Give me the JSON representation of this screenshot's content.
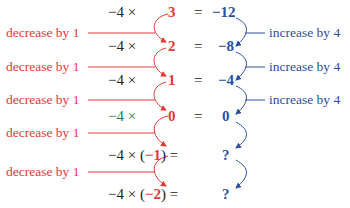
{
  "colors": {
    "decrease": "#e53935",
    "increase": "#2d4fa1",
    "text": "#222222",
    "highlight_row": "#2e7d32"
  },
  "rows": [
    {
      "lhs": "−4 ×",
      "factor": "3",
      "paren": false,
      "eq": "=",
      "result": "−12"
    },
    {
      "lhs": "−4 ×",
      "factor": "2",
      "paren": false,
      "eq": "=",
      "result": "−8"
    },
    {
      "lhs": "−4 ×",
      "factor": "1",
      "paren": false,
      "eq": "=",
      "result": "−4"
    },
    {
      "lhs": "−4 ×",
      "factor": "0",
      "paren": false,
      "eq": "=",
      "result": "0"
    },
    {
      "lhs": "−4 ×",
      "factor": "−1",
      "paren": true,
      "eq": "=",
      "result": "?"
    },
    {
      "lhs": "−4 ×",
      "factor": "−2",
      "paren": true,
      "eq": "=",
      "result": "?"
    }
  ],
  "paren_open": "(",
  "paren_close": ")",
  "left_labels": [
    "decrease by 1",
    "decrease by 1",
    "decrease by 1",
    "decrease by 1",
    "decrease by 1"
  ],
  "right_labels": [
    "increase by 4",
    "increase by 4",
    "increase by 4"
  ]
}
